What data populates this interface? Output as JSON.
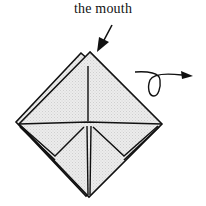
{
  "diagram": {
    "label": "the mouth",
    "colors": {
      "line": "#111111",
      "paper_fill": "#e6e6e6",
      "background": "#ffffff"
    },
    "icons": {
      "pointer_arrow": "pointer-arrow-icon",
      "turn_over_arrow": "turn-over-arrow-icon"
    }
  }
}
